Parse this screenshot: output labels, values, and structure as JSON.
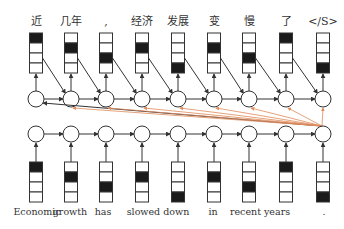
{
  "diagram": {
    "type": "seq2seq-attention",
    "colors": {
      "line": "#333333",
      "fill_dark": "#1a1a1a",
      "attention": "#e08a5a",
      "bg": "#ffffff"
    },
    "decoder": {
      "tokens": [
        "近",
        "几年",
        ",",
        "经济",
        "发展",
        "变",
        "慢",
        "了",
        "</S>"
      ],
      "active_cell": [
        0,
        1,
        2,
        1,
        3,
        1,
        2,
        0,
        3
      ]
    },
    "encoder": {
      "tokens": [
        "Economic",
        "growth",
        "has",
        "slowed down",
        "in",
        "recent years",
        "."
      ],
      "token_positions": [
        37,
        70,
        103,
        158,
        213,
        260,
        324
      ],
      "active_cell": [
        0,
        1,
        2,
        1,
        3,
        1,
        2,
        0,
        3
      ]
    }
  }
}
